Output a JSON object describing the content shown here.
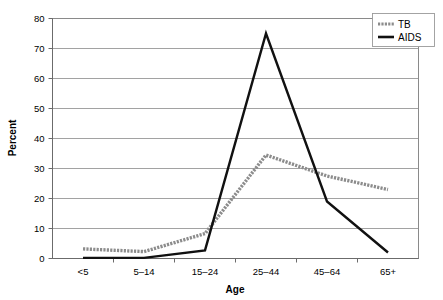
{
  "chart_data": {
    "type": "line",
    "title": "",
    "xlabel": "Age",
    "ylabel": "Percent",
    "categories": [
      "<5",
      "5–14",
      "15–24",
      "25–44",
      "45–64",
      "65+"
    ],
    "ylim": [
      0,
      80
    ],
    "yticks": [
      0,
      10,
      20,
      30,
      40,
      50,
      60,
      70,
      80
    ],
    "ytick_labels": [
      "0",
      "10",
      "20",
      "30",
      "40",
      "50",
      "60",
      "70",
      "80"
    ],
    "grid": true,
    "legend_position": "top-right",
    "series": [
      {
        "name": "TB",
        "values": [
          3.2,
          2.3,
          8.3,
          34.5,
          27.5,
          23.0
        ],
        "color": "#8c8c8c",
        "style": "dotted-thick"
      },
      {
        "name": "AIDS",
        "values": [
          0.2,
          0.2,
          2.7,
          75.0,
          19.0,
          2.0
        ],
        "color": "#111111",
        "style": "solid"
      }
    ]
  },
  "legend": {
    "entries": [
      {
        "label": "TB"
      },
      {
        "label": "AIDS"
      }
    ]
  },
  "axes": {
    "x_title": "Age",
    "y_title": "Percent"
  }
}
